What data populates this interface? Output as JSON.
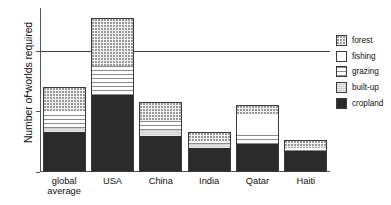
{
  "chart_data": {
    "type": "bar",
    "title": "",
    "subtitle": "",
    "xlabel": "",
    "ylabel": "Number of worlds required",
    "ylim": [
      0,
      1.35
    ],
    "yticks": [
      0,
      0.5,
      1
    ],
    "ytick_labels": [
      "0",
      "0.5",
      "1"
    ],
    "grid": false,
    "reference_line": {
      "value": 1,
      "label": ""
    },
    "legend_position": "right",
    "stacked": true,
    "categories": [
      "global average",
      "USA",
      "China",
      "India",
      "Qatar",
      "Haiti"
    ],
    "series": [
      {
        "name": "cropland",
        "values": [
          0.33,
          0.63,
          0.3,
          0.2,
          0.23,
          0.17
        ]
      },
      {
        "name": "built-up",
        "values": [
          0.03,
          0.0,
          0.05,
          0.03,
          0.0,
          0.0
        ]
      },
      {
        "name": "grazing",
        "values": [
          0.12,
          0.24,
          0.07,
          0.02,
          0.09,
          0.03
        ]
      },
      {
        "name": "fishing",
        "values": [
          0.02,
          0.0,
          0.0,
          0.0,
          0.16,
          0.0
        ]
      },
      {
        "name": "forest",
        "values": [
          0.2,
          0.4,
          0.16,
          0.08,
          0.07,
          0.06
        ]
      }
    ],
    "totals": [
      0.7,
      1.27,
      0.58,
      0.33,
      0.55,
      0.26
    ]
  },
  "axis": {
    "y_title": "Number of worlds required",
    "ytick_0": "0",
    "ytick_half": "0.5",
    "ytick_one": "1"
  },
  "categories": [
    {
      "id": "global-average",
      "line1": "global",
      "line2": "average",
      "full": "global average"
    },
    {
      "id": "usa",
      "line1": "USA",
      "line2": "",
      "full": "USA"
    },
    {
      "id": "china",
      "line1": "China",
      "line2": "",
      "full": "China"
    },
    {
      "id": "india",
      "line1": "India",
      "line2": "",
      "full": "India"
    },
    {
      "id": "qatar",
      "line1": "Qatar",
      "line2": "",
      "full": "Qatar"
    },
    {
      "id": "haiti",
      "line1": "Haiti",
      "line2": "",
      "full": "Haiti"
    }
  ],
  "legend": {
    "items": [
      {
        "key": "forest",
        "label": "forest"
      },
      {
        "key": "fishing",
        "label": "fishing"
      },
      {
        "key": "grazing",
        "label": "grazing"
      },
      {
        "key": "built-up",
        "label": "built-up"
      },
      {
        "key": "cropland",
        "label": "cropland"
      }
    ]
  },
  "colors": {
    "cropland": "#2b2b2b",
    "built_up": "#cfcfcf",
    "grazing": "#8c8c8c",
    "fishing": "#ffffff",
    "forest": "#9a9a9a",
    "axis": "#555555",
    "reference_line": "#444444"
  }
}
